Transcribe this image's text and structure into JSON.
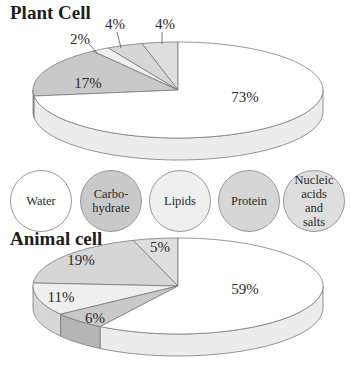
{
  "colors": {
    "water": "#ffffff",
    "carbohydrate": "#c9c9c9",
    "lipids": "#efefef",
    "protein": "#d6d6d6",
    "nucleic": "#dedede",
    "outline": "#7a7a7a"
  },
  "legend": {
    "items": [
      {
        "key": "water",
        "label": "Water"
      },
      {
        "key": "carbohydrate",
        "label": "Carbo-\nhydrate"
      },
      {
        "key": "lipids",
        "label": "Lipids"
      },
      {
        "key": "protein",
        "label": "Protein"
      },
      {
        "key": "nucleic",
        "label": "Nucleic\nacids\nand\nsalts"
      }
    ]
  },
  "chart_data": [
    {
      "type": "pie",
      "title": "Plant Cell",
      "categories": [
        "Water",
        "Carbohydrate",
        "Lipids",
        "Protein",
        "Nucleic acids and salts"
      ],
      "values": [
        73,
        17,
        2,
        4,
        4
      ],
      "labels": [
        "73%",
        "17%",
        "2%",
        "4%",
        "4%"
      ],
      "style": "3d-exploded-none",
      "legend_position": "between charts"
    },
    {
      "type": "pie",
      "title": "Animal cell",
      "categories": [
        "Water",
        "Carbohydrate",
        "Lipids",
        "Protein",
        "Nucleic acids and salts"
      ],
      "values": [
        59,
        6,
        11,
        19,
        5
      ],
      "labels": [
        "59%",
        "6%",
        "11%",
        "19%",
        "5%"
      ],
      "style": "3d",
      "legend_position": "between charts"
    }
  ]
}
